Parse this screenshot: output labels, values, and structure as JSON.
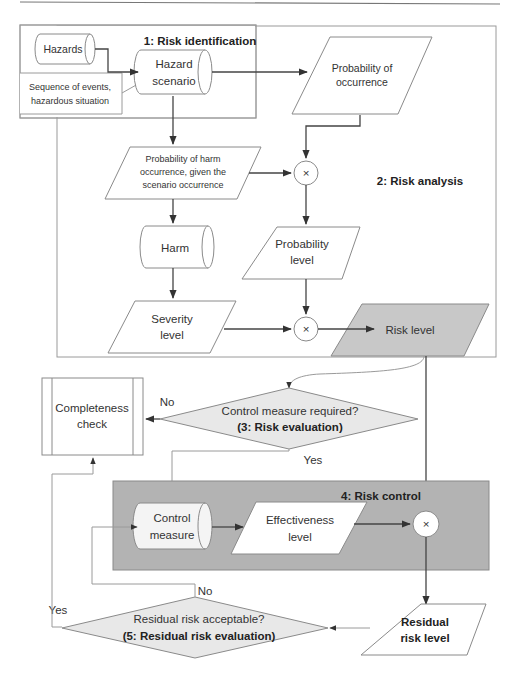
{
  "stages": {
    "risk_identification": "1: Risk identification",
    "risk_analysis": "2: Risk analysis",
    "risk_evaluation": "(3: Risk evaluation)",
    "risk_control": "4: Risk control",
    "residual_risk_evaluation": "(5: Residual risk evaluation)"
  },
  "nodes": {
    "hazards": "Hazards",
    "hazard_scenario": [
      "Hazard",
      "scenario"
    ],
    "sequence_of_events": [
      "Sequence of events,",
      "hazardous situation"
    ],
    "probability_of_occurrence": [
      "Probability of",
      "occurrence"
    ],
    "probability_of_harm": [
      "Probability of harm",
      "occurrence, given the",
      "scenario occurrence"
    ],
    "harm": "Harm",
    "probability_level": [
      "Probability",
      "level"
    ],
    "severity_level": [
      "Severity",
      "level"
    ],
    "risk_level": "Risk level",
    "completeness_check": [
      "Completeness",
      "check"
    ],
    "control_measure_required": "Control measure required?",
    "control_measure": [
      "Control",
      "measure"
    ],
    "effectiveness_level": [
      "Effectiveness",
      "level"
    ],
    "residual_risk_acceptable": "Residual risk acceptable?",
    "residual_risk_level": [
      "Residual",
      "risk level"
    ]
  },
  "operators": {
    "multiply": "×"
  },
  "labels": {
    "no": "No",
    "yes": "Yes"
  },
  "colors": {
    "risk_level_fill": "#c8c8c8",
    "risk_control_fill": "#b3b3b3",
    "decision_fill": "#e8e8e8"
  }
}
